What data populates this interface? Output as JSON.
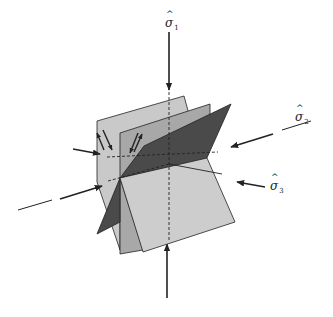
{
  "diagram": {
    "type": "stress-axes-conjugate-fault-planes",
    "colors": {
      "background": "#ffffff",
      "plane_light": "#c9c9c9",
      "plane_mid": "#a8a8a8",
      "plane_dark": "#4a4a4a",
      "plane_front": "#cdcdcd",
      "stroke": "#222222"
    },
    "labels": {
      "sigma1": {
        "symbol": "σ",
        "hat": "^",
        "subscript": "1"
      },
      "sigma2": {
        "symbol": "σ",
        "hat": "^",
        "subscript": "2"
      },
      "sigma3": {
        "symbol": "σ",
        "hat": "^",
        "subscript": "3"
      }
    },
    "arrows": [
      {
        "name": "sigma1-top-arrow",
        "direction": "down"
      },
      {
        "name": "sigma1-bottom-arrow",
        "direction": "up"
      },
      {
        "name": "sigma2-right-arrow",
        "direction": "inward"
      },
      {
        "name": "sigma2-left-arrow",
        "direction": "inward"
      },
      {
        "name": "sigma3-right-arrow",
        "direction": "inward"
      },
      {
        "name": "sigma3-left-arrow",
        "direction": "inward"
      }
    ],
    "slip_arrows": 4
  }
}
